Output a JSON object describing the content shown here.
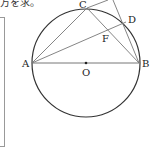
{
  "caption": "方を求。",
  "figure": {
    "points": {
      "A": "A",
      "B": "B",
      "C": "C",
      "D": "D",
      "F": "F",
      "O": "O"
    }
  }
}
